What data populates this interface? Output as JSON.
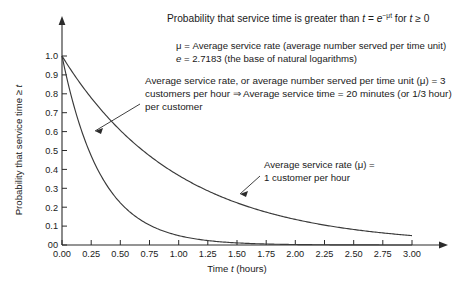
{
  "chart_data": {
    "type": "line",
    "title": "Probability that service time is greater than t = e−μt for t ≥ 0",
    "title_parts": {
      "lead": "Probability that service time is greater than ",
      "var_t": "t",
      "equals": " = ",
      "base": "e",
      "exponent": "−μt",
      "tail_lead": " for ",
      "tail_var": "t",
      "tail_rest": " ≥ 0"
    },
    "xlabel": "Time t (hours)",
    "xlabel_parts": {
      "lead": "Time ",
      "var": "t",
      "rest": " (hours)"
    },
    "ylabel": "Probability that service time ≥ t",
    "ylabel_parts": {
      "lead": "Probability that service time ≥ ",
      "var": "t"
    },
    "xlim": [
      0,
      3.0
    ],
    "ylim": [
      0,
      1.0
    ],
    "grid": false,
    "legend": "annotations",
    "x_ticks": [
      "0.00",
      "0.25",
      "0.50",
      "0.75",
      "1.00",
      "1.25",
      "1.50",
      "1.75",
      "2.00",
      "2.25",
      "2.50",
      "2.75",
      "3.00"
    ],
    "x_tick_values": [
      0,
      0.25,
      0.5,
      0.75,
      1.0,
      1.25,
      1.5,
      1.75,
      2.0,
      2.25,
      2.5,
      2.75,
      3.0
    ],
    "y_ticks": [
      "00",
      "0.1",
      "0.2",
      "0.3",
      "0.4",
      "0.5",
      "0.6",
      "0.7",
      "0.8",
      "0.9",
      "1.0"
    ],
    "y_tick_values": [
      0,
      0.1,
      0.2,
      0.3,
      0.4,
      0.5,
      0.6,
      0.7,
      0.8,
      0.9,
      1.0
    ],
    "x": [
      0,
      0.125,
      0.25,
      0.375,
      0.5,
      0.625,
      0.75,
      0.875,
      1.0,
      1.125,
      1.25,
      1.375,
      1.5,
      1.625,
      1.75,
      1.875,
      2.0,
      2.125,
      2.25,
      2.375,
      2.5,
      2.625,
      2.75,
      2.875,
      3.0
    ],
    "series": [
      {
        "name": "Average service rate (μ) = 1 customer per hour",
        "mu": 1,
        "values": [
          1.0,
          0.8825,
          0.7788,
          0.6873,
          0.6065,
          0.5353,
          0.4724,
          0.4169,
          0.3679,
          0.3247,
          0.2865,
          0.2528,
          0.2231,
          0.1969,
          0.1738,
          0.1534,
          0.1353,
          0.1194,
          0.1054,
          0.093,
          0.0821,
          0.0724,
          0.0639,
          0.0564,
          0.0498
        ]
      },
      {
        "name": "Average service rate (μ) = 3 customers per hour",
        "mu": 3,
        "values": [
          1.0,
          0.6873,
          0.4724,
          0.3247,
          0.2231,
          0.1534,
          0.1054,
          0.0724,
          0.0498,
          0.0342,
          0.0235,
          0.0162,
          0.0111,
          0.0076,
          0.0052,
          0.0036,
          0.0025,
          0.0017,
          0.0012,
          0.0008,
          0.0006,
          0.0004,
          0.0003,
          0.0002,
          0.0001
        ]
      }
    ],
    "annotations": [
      {
        "id": "mu-3-note",
        "lines": [
          "Average service rate, or average number served per time unit (μ) = 3",
          "customers per hour ⇒ Average service time = 20 minutes (or 1/3 hour)",
          "per customer"
        ],
        "points_to_series": "Average service rate (μ) = 3 customers per hour"
      },
      {
        "id": "mu-1-note",
        "lines": [
          "Average service rate (μ) =",
          "1 customer per hour"
        ],
        "points_to_series": "Average service rate (μ) = 1 customer per hour"
      }
    ],
    "definitions": [
      "μ = Average service rate (average number served per time unit)",
      "e = 2.7183 (the base of natural logarithms)"
    ],
    "definition_parts": [
      {
        "lead": "μ",
        "rest": " = Average service rate (average number served per time unit)"
      },
      {
        "lead": "e",
        "rest": " = 2.7183 (the base of natural logarithms)"
      }
    ],
    "colors": {
      "curve": "#3a3a3a",
      "axis": "#2b2b2b",
      "text": "#1a1a1a",
      "background": "#ffffff"
    }
  }
}
